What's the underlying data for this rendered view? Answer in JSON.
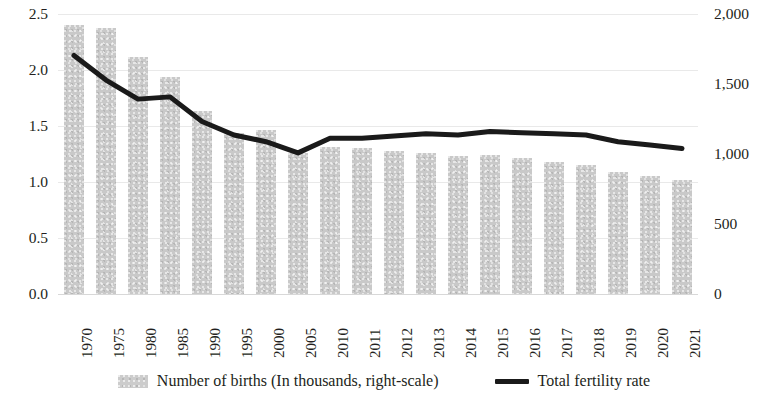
{
  "chart_data": {
    "type": "bar",
    "title": "",
    "subtitle": "",
    "xlabel": "",
    "ylabel": "",
    "grid": true,
    "legend_position": "bottom",
    "categories": [
      "1970",
      "1975",
      "1980",
      "1985",
      "1990",
      "1995",
      "2000",
      "2005",
      "2010",
      "2011",
      "2012",
      "2013",
      "2014",
      "2015",
      "2016",
      "2017",
      "2018",
      "2019",
      "2020",
      "2021"
    ],
    "axes": {
      "left": {
        "label": "Total fertility rate",
        "min": 0.0,
        "max": 2.5,
        "step": 0.5,
        "ticks": [
          "0.0",
          "0.5",
          "1.0",
          "1.5",
          "2.0",
          "2.5"
        ],
        "tick_values": [
          0.0,
          0.5,
          1.0,
          1.5,
          2.0,
          2.5
        ]
      },
      "right": {
        "label": "Number of births (In thousands)",
        "min": 0,
        "max": 2000,
        "step": 500,
        "ticks": [
          "0",
          "500",
          "1,000",
          "1,500",
          "2,000"
        ],
        "tick_values": [
          0,
          500,
          1000,
          1500,
          2000
        ]
      }
    },
    "series": [
      {
        "name": "Number of births (In thousands, right-scale)",
        "type": "bar",
        "axis": "right",
        "color": "#c9c9c9",
        "values": [
          1920,
          1900,
          1690,
          1550,
          1310,
          1150,
          1170,
          1010,
          1050,
          1045,
          1020,
          1005,
          985,
          995,
          970,
          945,
          920,
          870,
          845,
          815
        ]
      },
      {
        "name": "Total fertility rate",
        "type": "line",
        "axis": "left",
        "color": "#1a1a1a",
        "values": [
          2.13,
          1.91,
          1.74,
          1.76,
          1.54,
          1.42,
          1.36,
          1.26,
          1.39,
          1.39,
          1.41,
          1.43,
          1.42,
          1.45,
          1.44,
          1.43,
          1.42,
          1.36,
          1.33,
          1.3
        ]
      }
    ]
  },
  "legend": {
    "items": [
      {
        "label": "Number of births (In thousands, right-scale)",
        "marker": "bar-swatch"
      },
      {
        "label": "Total fertility rate",
        "marker": "line-swatch"
      }
    ]
  }
}
